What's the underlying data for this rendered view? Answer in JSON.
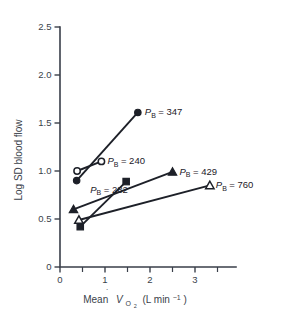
{
  "chart_data": {
    "type": "scatter",
    "title": "",
    "xlabel": "Mean VO2 (L min-1)",
    "xlabel_parts": {
      "lead": "Mean",
      "v": "V",
      "sub": "O",
      "sub2": "2",
      "tail": "(L min",
      "sup": "−1",
      "close": ")"
    },
    "ylabel": "Log SD blood flow",
    "xlim": [
      0,
      3.6
    ],
    "ylim": [
      0,
      2.5
    ],
    "xticks": [
      0,
      1,
      2,
      3
    ],
    "xtick_labels": [
      "0",
      "1",
      "2",
      "3"
    ],
    "xminor_ticks": [
      0.5,
      1.5,
      2.5,
      3.5
    ],
    "yticks": [
      0,
      0.5,
      1.0,
      1.5,
      2.0,
      2.5
    ],
    "ytick_labels": [
      "0",
      "0.5",
      "1.0",
      "1.5",
      "2.0",
      "2.5"
    ],
    "grid": false,
    "legend_position": "inline-annotations",
    "series": [
      {
        "name": "PB = 347",
        "label_prefix": "P",
        "label_sub": "B",
        "label_value": "= 347",
        "marker": "filled-circle",
        "x": [
          0.37,
          1.73
        ],
        "y": [
          0.9,
          1.61
        ],
        "label_at": {
          "x": 1.73,
          "y": 1.61
        },
        "label_dx": 7,
        "label_dy": 3
      },
      {
        "name": "PB = 240",
        "label_prefix": "P",
        "label_sub": "B",
        "label_value": "= 240",
        "marker": "open-circle",
        "x": [
          0.38,
          0.92
        ],
        "y": [
          1.0,
          1.1
        ],
        "label_at": {
          "x": 0.92,
          "y": 1.1
        },
        "label_dx": 6,
        "label_dy": 3
      },
      {
        "name": "PB = 282",
        "label_prefix": "P",
        "label_sub": "B",
        "label_value": "= 282",
        "marker": "filled-square",
        "x": [
          0.45,
          1.47
        ],
        "y": [
          0.42,
          0.89
        ],
        "label_at": {
          "x": 0.45,
          "y": 0.9
        },
        "label_dx": 10,
        "label_dy": 12
      },
      {
        "name": "PB = 429",
        "label_prefix": "P",
        "label_sub": "B",
        "label_value": "= 429",
        "marker": "filled-triangle",
        "x": [
          0.3,
          2.5
        ],
        "y": [
          0.6,
          0.99
        ],
        "label_at": {
          "x": 2.5,
          "y": 0.99
        },
        "label_dx": 7,
        "label_dy": 3
      },
      {
        "name": "PB = 760",
        "label_prefix": "P",
        "label_sub": "B",
        "label_value": "= 760",
        "marker": "open-triangle",
        "x": [
          0.42,
          3.33
        ],
        "y": [
          0.49,
          0.85
        ],
        "label_at": {
          "x": 3.33,
          "y": 0.85
        },
        "label_dx": 6,
        "label_dy": 3
      }
    ]
  }
}
